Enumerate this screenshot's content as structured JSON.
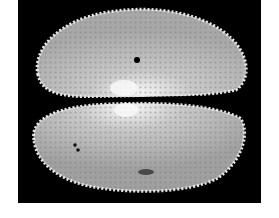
{
  "image": {
    "subject": "ostracod carapace, two valves (upper and lower), ornamented with reticulate surface and spiny margins",
    "background_color": "#000000",
    "page_color": "#ffffff",
    "shell_color": "#d8d8d8",
    "highlight_color": "#f4f4f4",
    "valves": [
      {
        "name": "upper-valve",
        "features": [
          "central pore",
          "bright muscle-scar area near hinge"
        ]
      },
      {
        "name": "lower-valve",
        "features": [
          "two small pores on left",
          "dark blemish near lower margin"
        ]
      }
    ]
  }
}
